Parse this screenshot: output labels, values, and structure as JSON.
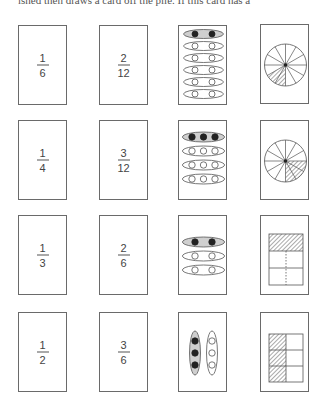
{
  "page": {
    "top_text": "ished then draws a card off the pile. If this card has a"
  },
  "colors": {
    "border": "#6a6a6a",
    "shade": "#cfcfcf",
    "dot": "#222222",
    "hatch": "#555555"
  },
  "rows": [
    {
      "fraction": {
        "numerator": "1",
        "denominator": "6"
      },
      "equivalent": {
        "numerator": "2",
        "denominator": "12"
      },
      "set_model": {
        "groups": 6,
        "per_group": 2,
        "shaded_groups": 1,
        "orientation": "horizontal"
      },
      "area_model": {
        "type": "circle",
        "parts": 12,
        "shaded": 2
      }
    },
    {
      "fraction": {
        "numerator": "1",
        "denominator": "4"
      },
      "equivalent": {
        "numerator": "3",
        "denominator": "12"
      },
      "set_model": {
        "groups": 4,
        "per_group": 3,
        "shaded_groups": 1,
        "orientation": "horizontal"
      },
      "area_model": {
        "type": "circle",
        "parts": 12,
        "shaded": 3
      }
    },
    {
      "fraction": {
        "numerator": "1",
        "denominator": "3"
      },
      "equivalent": {
        "numerator": "2",
        "denominator": "6"
      },
      "set_model": {
        "groups": 3,
        "per_group": 2,
        "shaded_groups": 1,
        "orientation": "horizontal"
      },
      "area_model": {
        "type": "rectangle",
        "rows": 3,
        "cols": 2,
        "shaded": "top row"
      }
    },
    {
      "fraction": {
        "numerator": "1",
        "denominator": "2"
      },
      "equivalent": {
        "numerator": "3",
        "denominator": "6"
      },
      "set_model": {
        "groups": 2,
        "per_group": 3,
        "shaded_groups": 1,
        "orientation": "vertical"
      },
      "area_model": {
        "type": "rectangle",
        "rows": 3,
        "cols": 2,
        "shaded": "left column"
      }
    }
  ]
}
